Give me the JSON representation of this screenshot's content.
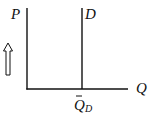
{
  "diagram": {
    "type": "supply-demand",
    "y_axis_label": "P",
    "x_axis_label": "Q",
    "curve_label": "D",
    "quantity_label": "Q",
    "quantity_subscript": "D",
    "quantity_bar": true,
    "arrow_direction": "up",
    "colors": {
      "line": "#111111",
      "background": "#ffffff"
    }
  }
}
